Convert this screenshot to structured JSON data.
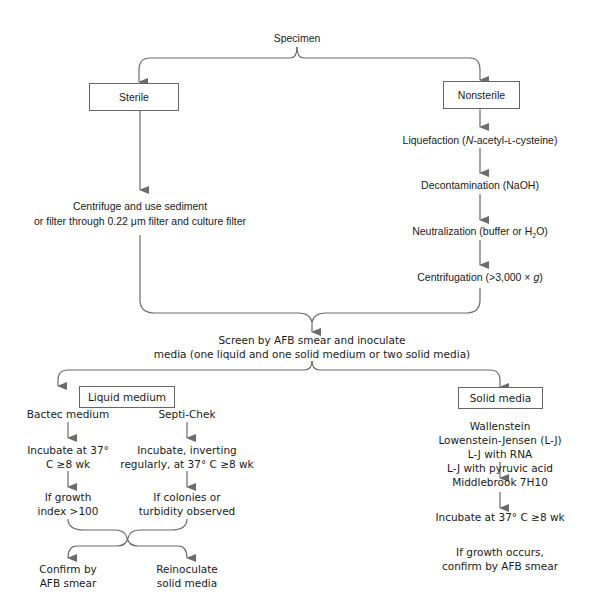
{
  "root": {
    "label": "Specimen"
  },
  "branches": {
    "sterile": {
      "label": "Sterile",
      "step_line1": "Centrifuge and use sediment",
      "step_line2": "or filter through 0.22 μm filter and culture filter"
    },
    "nonsterile": {
      "label": "Nonsterile",
      "steps": [
        {
          "pre": "Liquefaction (",
          "ital": "N",
          "post": "-acetyl-ʟ-cysteine)"
        },
        {
          "text": "Decontamination (NaOH)"
        },
        {
          "pre": "Neutralization (buffer or H",
          "sub": "2",
          "post": "O)"
        },
        {
          "pre": "Centrifugation (>3,000 × ",
          "ital": "g",
          "post": ")"
        }
      ]
    }
  },
  "merge": {
    "line1": "Screen by AFB smear and inoculate",
    "line2": "media (one liquid and one solid medium or two solid media)"
  },
  "liquid": {
    "label": "Liquid medium",
    "bactec": {
      "title": "Bactec medium",
      "incubate_line1": "Incubate at 37°",
      "incubate_line2": "C ≥8 wk",
      "cond_line1": "If growth",
      "cond_line2": "index >100"
    },
    "septichek": {
      "title": "Septi-Chek",
      "incubate_line1": "Incubate, inverting",
      "incubate_line2": "regularly, at 37° C ≥8 wk",
      "cond_line1": "If colonies or",
      "cond_line2": "turbidity observed"
    },
    "outcomes": {
      "confirm_line1": "Confirm by",
      "confirm_line2": "AFB smear",
      "reinoc_line1": "Reinoculate",
      "reinoc_line2": "solid media"
    }
  },
  "solid": {
    "label": "Solid media",
    "media": [
      "Wallenstein",
      "Lowenstein-Jensen (L-J)",
      "L-J with RNA",
      "L-J with pyruvic acid",
      "Middlebrook 7H10"
    ],
    "incubate": "Incubate at 37° C ≥8 wk",
    "result_line1": "If growth occurs,",
    "result_line2": "confirm by AFB smear"
  },
  "colors": {
    "line": "#6b6b6b",
    "text": "#1a1a1a",
    "box_border": "#666666"
  }
}
